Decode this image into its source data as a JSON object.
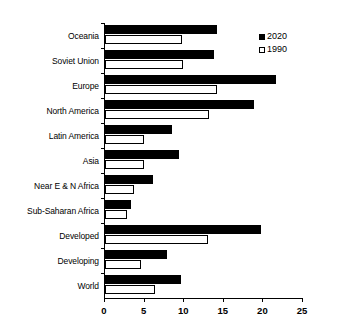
{
  "chart_data": {
    "type": "bar",
    "orientation": "horizontal",
    "title": "",
    "subtitle": "",
    "xlabel": "",
    "ylabel": "",
    "xlim": [
      0,
      25
    ],
    "xticks": [
      0,
      5,
      10,
      15,
      20,
      25
    ],
    "xtick_labels": [
      "0",
      "5",
      "10",
      "15",
      "20",
      "25"
    ],
    "grid": false,
    "legend_position": "top-right",
    "categories": [
      "Oceania",
      "Soviet Union",
      "Europe",
      "North America",
      "Latin America",
      "Asia",
      "Near E & N Africa",
      "Sub-Saharan Africa",
      "Developed",
      "Developing",
      "World"
    ],
    "series": [
      {
        "name": "2020",
        "color": "#000000",
        "fill": "solid",
        "values": [
          14.2,
          13.8,
          21.6,
          18.8,
          8.5,
          9.3,
          6.1,
          3.3,
          19.7,
          7.8,
          9.6
        ]
      },
      {
        "name": "1990",
        "color": "#ffffff",
        "fill": "hollow",
        "values": [
          9.7,
          9.8,
          14.2,
          13.1,
          4.9,
          4.9,
          3.7,
          2.8,
          13.0,
          4.5,
          6.3
        ]
      }
    ]
  },
  "legend": {
    "entries": [
      {
        "label": "2020",
        "swatch": "filled-square-icon"
      },
      {
        "label": "1990",
        "swatch": "hollow-square-icon"
      }
    ]
  }
}
